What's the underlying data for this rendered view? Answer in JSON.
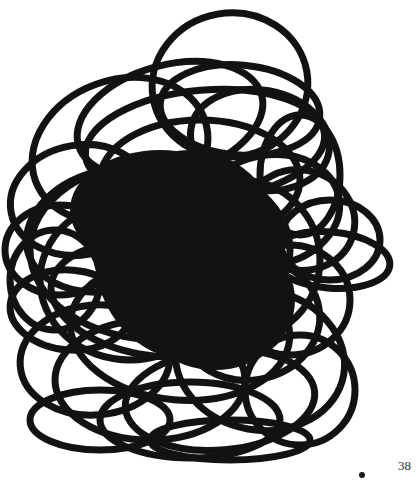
{
  "page": {
    "page_number": "38",
    "background": "#ffffff",
    "ink_color": "#121212"
  },
  "illustration": {
    "kind": "scribble-of-looping-ellipses",
    "bounds": {
      "x": 10,
      "y": 10,
      "width": 385,
      "height": 448
    },
    "center": {
      "cx": 190,
      "cy": 260
    }
  }
}
